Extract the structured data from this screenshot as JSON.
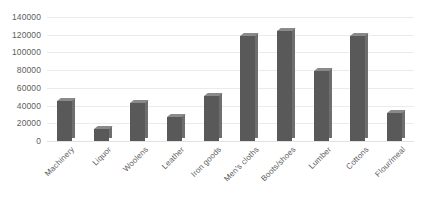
{
  "chart_data": {
    "type": "bar",
    "title": "",
    "xlabel": "",
    "ylabel": "",
    "ylim": [
      0,
      140000
    ],
    "ytick_step": 20000,
    "grid": true,
    "legend": "none",
    "orientation": "vertical",
    "style": "3d-shaded-bars",
    "bar_color": "#595959",
    "bar_top_color": "#8a8a8a",
    "bar_side_color": "#6e6e6e",
    "gridline_color": "#eceaea",
    "background": "#ffffff",
    "categories": [
      "Machinery",
      "Liquor",
      "Woolens",
      "Leather",
      "Iron goods",
      "Men's cloths",
      "Boots/shoes",
      "Lumber",
      "Cottons",
      "Flour/meal"
    ],
    "values": [
      45000,
      14000,
      43000,
      27000,
      51000,
      119000,
      124000,
      79000,
      119000,
      32000
    ],
    "ytick_labels": [
      "140000",
      "120000",
      "100000",
      "80000",
      "60000",
      "40000",
      "20000",
      "0"
    ],
    "ytick_values": [
      140000,
      120000,
      100000,
      80000,
      60000,
      40000,
      20000,
      0
    ]
  }
}
